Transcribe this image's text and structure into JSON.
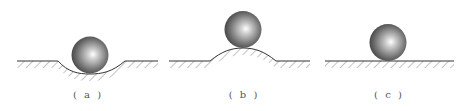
{
  "figure": {
    "panels": [
      {
        "id": "a",
        "label": "( a )",
        "surface": "concave",
        "description": "ball resting in a depression"
      },
      {
        "id": "b",
        "label": "( b )",
        "surface": "convex",
        "description": "ball resting on top of a hump"
      },
      {
        "id": "c",
        "label": "( c )",
        "surface": "flat",
        "description": "ball resting on flat ground"
      }
    ],
    "colors": {
      "ground_line": "#333333",
      "hatch": "#888888",
      "ball_highlight": "#ffffff",
      "ball_shadow": "#3a3a3a"
    }
  }
}
